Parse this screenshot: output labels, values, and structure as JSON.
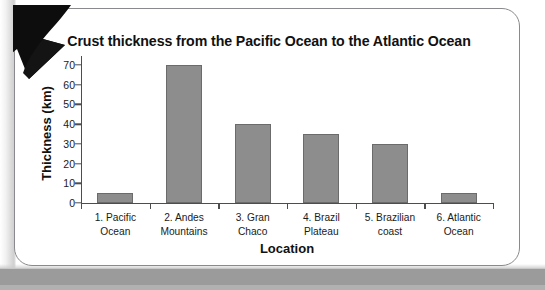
{
  "chart_data": {
    "type": "bar",
    "title": "Crust thickness from the Pacific Ocean to the Atlantic Ocean",
    "xlabel": "Location",
    "ylabel": "Thickness (km)",
    "categories": [
      "1. Pacific Ocean",
      "2. Andes Mountains",
      "3. Gran Chaco",
      "4. Brazil Plateau",
      "5. Brazilian coast",
      "6. Atlantic Ocean"
    ],
    "category_lines": [
      [
        "1. Pacific",
        "Ocean"
      ],
      [
        "2. Andes",
        "Mountains"
      ],
      [
        "3. Gran",
        "Chaco"
      ],
      [
        "4. Brazil",
        "Plateau"
      ],
      [
        "5. Brazilian",
        "coast"
      ],
      [
        "6. Atlantic",
        "Ocean"
      ]
    ],
    "values": [
      5,
      70,
      40,
      35,
      30,
      5
    ],
    "ylim": [
      0,
      70
    ],
    "yticks": [
      0,
      10,
      20,
      30,
      40,
      50,
      60,
      70
    ],
    "ytick_labels": [
      "0",
      "10",
      "20",
      "30",
      "40",
      "50",
      "60",
      "70"
    ],
    "grid": false,
    "legend": "none",
    "bar_color": "#8d8d8d",
    "bar_border_color": "#6b6b6b",
    "axis_color": "#4d4d4d",
    "text_color": "#111111"
  },
  "decor": {
    "arrow_name": "arrow-down-left",
    "card_border_color": "#8a8a8e",
    "page_band_color": "#9b9b9b"
  }
}
